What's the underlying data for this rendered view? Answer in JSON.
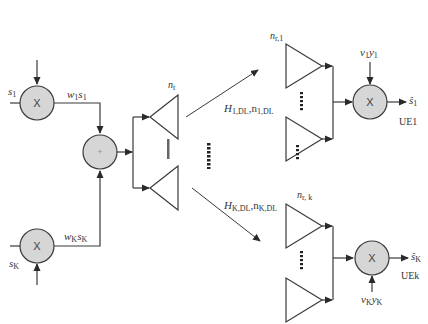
{
  "diagram": {
    "type": "block-diagram",
    "topic": "Multi-user MIMO downlink precoding and receive combining",
    "colors": {
      "stroke": "#3a3a3a",
      "node_fill": "#d6d6d6",
      "background": "#ffffff"
    },
    "nodes": {
      "mult_tx_1": {
        "symbol": "X",
        "input_label": "s",
        "input_sub": "1",
        "output_label_main": "w",
        "output_label_sub": "1",
        "output_label_tail": "s",
        "output_label_tail_sub": "1"
      },
      "mult_tx_k": {
        "symbol": "X",
        "input_label": "s",
        "input_sub": "K",
        "output_label_main": "w",
        "output_label_sub": "K",
        "output_label_tail": "s",
        "output_label_tail_sub": "K"
      },
      "sum": {
        "symbol": "+"
      },
      "tx_antennas": {
        "label": "n",
        "label_sub": "t"
      },
      "channel_1": {
        "label_main": "H",
        "label_sub": "1,DL",
        "label_sep": ",",
        "noise_main": "n",
        "noise_sub": "1,DL"
      },
      "channel_k": {
        "label_main": "H",
        "label_sub": "K,DL",
        "label_sep": ",",
        "noise_main": "n",
        "noise_sub": "K,DL"
      },
      "rx_antennas_1": {
        "label": "n",
        "label_sub": "r,1"
      },
      "rx_antennas_k": {
        "label": "n",
        "label_sub": "r, k"
      },
      "mult_rx_1": {
        "symbol": "X",
        "weight_main": "v",
        "weight_sub": "1",
        "weight_tail": "y",
        "weight_tail_sub": "1",
        "output_label": "ŝ",
        "output_sub": "1",
        "ue_label": "UE1"
      },
      "mult_rx_k": {
        "symbol": "X",
        "weight_main": "v",
        "weight_sub": "K",
        "weight_tail": "y",
        "weight_tail_sub": "K",
        "output_label": "ŝ",
        "output_sub": "K",
        "ue_label": "UEk"
      }
    },
    "edges": [
      {
        "from": "mult_tx_1",
        "to": "sum",
        "label": "w1 s1"
      },
      {
        "from": "mult_tx_k",
        "to": "sum",
        "label": "wK sK"
      },
      {
        "from": "sum",
        "to": "tx_antennas"
      },
      {
        "from": "tx_antennas",
        "to": "rx_antennas_1",
        "label": "H1,DL, n1,DL"
      },
      {
        "from": "tx_antennas",
        "to": "rx_antennas_k",
        "label": "HK,DL, nK,DL"
      },
      {
        "from": "rx_antennas_1",
        "to": "mult_rx_1"
      },
      {
        "from": "rx_antennas_k",
        "to": "mult_rx_k"
      },
      {
        "from": "mult_rx_1",
        "to": "output_1",
        "label": "ŝ1"
      },
      {
        "from": "mult_rx_k",
        "to": "output_k",
        "label": "ŝK"
      }
    ]
  }
}
